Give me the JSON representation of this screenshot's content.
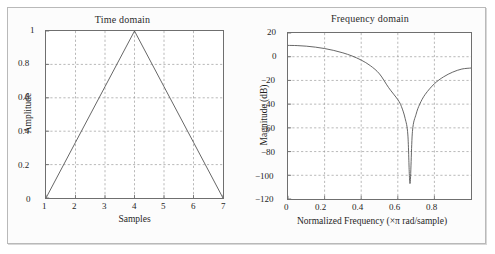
{
  "figure": {
    "background": "#fcfcfc",
    "frame_color": "#b9b9b9",
    "axis_color": "#6f6f6f",
    "grid_color": "#9a9a9a",
    "curve_color": "#545454"
  },
  "chart_data": [
    {
      "type": "line",
      "id": "time-domain",
      "title": "Time domain",
      "xlabel": "Samples",
      "ylabel": "Amplitude",
      "xlim": [
        1,
        7
      ],
      "ylim": [
        0,
        1
      ],
      "xticks": [
        "1",
        "2",
        "3",
        "4",
        "5",
        "6",
        "7"
      ],
      "xtick_values": [
        1,
        2,
        3,
        4,
        5,
        6,
        7
      ],
      "yticks": [
        "0",
        "0.2",
        "0.4",
        "0.6",
        "0.8",
        "1"
      ],
      "ytick_values": [
        0,
        0.2,
        0.4,
        0.6,
        0.8,
        1
      ],
      "grid": true,
      "grid_style": "dashed",
      "legend": null,
      "x": [
        1,
        2,
        3,
        4,
        5,
        6,
        7
      ],
      "values": [
        0,
        0.3333,
        0.6667,
        1,
        0.6667,
        0.3333,
        0
      ]
    },
    {
      "type": "line",
      "id": "frequency-domain",
      "title": "Frequency domain",
      "xlabel": "Normalized Frequency  (×π rad/sample)",
      "ylabel": "Magnitude (dB)",
      "xlim": [
        0,
        1
      ],
      "ylim": [
        -120,
        20
      ],
      "xticks": [
        "0",
        "0.2",
        "0.4",
        "0.6",
        "0.8"
      ],
      "xtick_values": [
        0,
        0.2,
        0.4,
        0.6,
        0.8
      ],
      "yticks": [
        "20",
        "0",
        "−20",
        "−40",
        "−60",
        "−80",
        "−100",
        "−120"
      ],
      "ytick_values": [
        20,
        0,
        -20,
        -40,
        -60,
        -80,
        -100,
        -120
      ],
      "grid": true,
      "grid_style": "dashed",
      "legend": null,
      "notch_frequency": 0.667,
      "notch_depth_db": -107,
      "x": [
        0,
        0.05,
        0.1,
        0.15,
        0.2,
        0.25,
        0.3,
        0.35,
        0.4,
        0.45,
        0.5,
        0.55,
        0.6,
        0.62,
        0.64,
        0.655,
        0.6667,
        0.68,
        0.7,
        0.72,
        0.75,
        0.8,
        0.85,
        0.9,
        0.95,
        1.0
      ],
      "values": [
        9.54,
        9.38,
        8.9,
        8.07,
        6.89,
        5.3,
        3.26,
        0.62,
        -2.84,
        -7.56,
        -14.5,
        -26.1,
        -36.2,
        -42.1,
        -52.0,
        -66.0,
        -107.0,
        -63.0,
        -48.5,
        -40.0,
        -31.7,
        -22.8,
        -17.0,
        -13.0,
        -10.4,
        -9.54
      ]
    }
  ]
}
